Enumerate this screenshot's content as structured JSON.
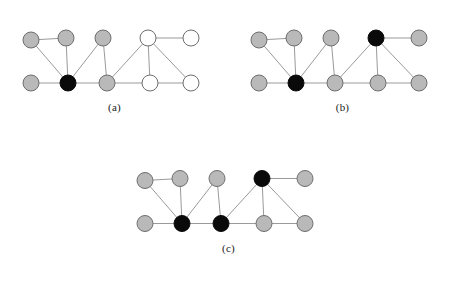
{
  "figure": {
    "type": "graph-diagram-set",
    "colors": {
      "gray_fill": "#b9b9b9",
      "white_fill": "#ffffff",
      "black_fill": "#0a0a0a",
      "node_stroke": "#6e6e6e",
      "edge_stroke": "#9a9a9a",
      "background": "#ffffff",
      "caption_text": "#1a1a1a"
    },
    "node_radius": 8,
    "panels": [
      {
        "id": "a",
        "caption": "(a)",
        "nodes": [
          {
            "id": "n0",
            "x": 31,
            "y": 25,
            "state": "gray"
          },
          {
            "id": "n1",
            "x": 66,
            "y": 23,
            "state": "gray"
          },
          {
            "id": "n2",
            "x": 103,
            "y": 23,
            "state": "gray"
          },
          {
            "id": "n3",
            "x": 148,
            "y": 23,
            "state": "white"
          },
          {
            "id": "n4",
            "x": 191,
            "y": 23,
            "state": "white"
          },
          {
            "id": "n5",
            "x": 31,
            "y": 68,
            "state": "gray"
          },
          {
            "id": "n6",
            "x": 68,
            "y": 68,
            "state": "black"
          },
          {
            "id": "n7",
            "x": 107,
            "y": 68,
            "state": "gray"
          },
          {
            "id": "n8",
            "x": 150,
            "y": 68,
            "state": "white"
          },
          {
            "id": "n9",
            "x": 191,
            "y": 68,
            "state": "white"
          }
        ],
        "edges": [
          [
            "n0",
            "n1"
          ],
          [
            "n0",
            "n6"
          ],
          [
            "n1",
            "n6"
          ],
          [
            "n2",
            "n6"
          ],
          [
            "n5",
            "n6"
          ],
          [
            "n6",
            "n7"
          ],
          [
            "n2",
            "n7"
          ],
          [
            "n7",
            "n3"
          ],
          [
            "n7",
            "n8"
          ],
          [
            "n3",
            "n4"
          ],
          [
            "n3",
            "n8"
          ],
          [
            "n3",
            "n9"
          ],
          [
            "n8",
            "n9"
          ]
        ]
      },
      {
        "id": "b",
        "caption": "(b)",
        "nodes": [
          {
            "id": "n0",
            "x": 31,
            "y": 25,
            "state": "gray"
          },
          {
            "id": "n1",
            "x": 66,
            "y": 23,
            "state": "gray"
          },
          {
            "id": "n2",
            "x": 103,
            "y": 23,
            "state": "gray"
          },
          {
            "id": "n3",
            "x": 148,
            "y": 23,
            "state": "black"
          },
          {
            "id": "n4",
            "x": 191,
            "y": 23,
            "state": "gray"
          },
          {
            "id": "n5",
            "x": 31,
            "y": 68,
            "state": "gray"
          },
          {
            "id": "n6",
            "x": 68,
            "y": 68,
            "state": "black"
          },
          {
            "id": "n7",
            "x": 107,
            "y": 68,
            "state": "gray"
          },
          {
            "id": "n8",
            "x": 150,
            "y": 68,
            "state": "gray"
          },
          {
            "id": "n9",
            "x": 191,
            "y": 68,
            "state": "gray"
          }
        ],
        "edges": [
          [
            "n0",
            "n1"
          ],
          [
            "n0",
            "n6"
          ],
          [
            "n1",
            "n6"
          ],
          [
            "n2",
            "n6"
          ],
          [
            "n5",
            "n6"
          ],
          [
            "n6",
            "n7"
          ],
          [
            "n2",
            "n7"
          ],
          [
            "n7",
            "n3"
          ],
          [
            "n7",
            "n8"
          ],
          [
            "n3",
            "n4"
          ],
          [
            "n3",
            "n8"
          ],
          [
            "n3",
            "n9"
          ],
          [
            "n8",
            "n9"
          ]
        ]
      },
      {
        "id": "c",
        "caption": "(c)",
        "nodes": [
          {
            "id": "n0",
            "x": 31,
            "y": 25,
            "state": "gray"
          },
          {
            "id": "n1",
            "x": 66,
            "y": 23,
            "state": "gray"
          },
          {
            "id": "n2",
            "x": 103,
            "y": 23,
            "state": "gray"
          },
          {
            "id": "n3",
            "x": 148,
            "y": 23,
            "state": "black"
          },
          {
            "id": "n4",
            "x": 191,
            "y": 23,
            "state": "gray"
          },
          {
            "id": "n5",
            "x": 31,
            "y": 68,
            "state": "gray"
          },
          {
            "id": "n6",
            "x": 68,
            "y": 68,
            "state": "black"
          },
          {
            "id": "n7",
            "x": 107,
            "y": 68,
            "state": "black"
          },
          {
            "id": "n8",
            "x": 150,
            "y": 68,
            "state": "gray"
          },
          {
            "id": "n9",
            "x": 191,
            "y": 68,
            "state": "gray"
          }
        ],
        "edges": [
          [
            "n0",
            "n1"
          ],
          [
            "n0",
            "n6"
          ],
          [
            "n1",
            "n6"
          ],
          [
            "n2",
            "n6"
          ],
          [
            "n5",
            "n6"
          ],
          [
            "n6",
            "n7"
          ],
          [
            "n2",
            "n7"
          ],
          [
            "n7",
            "n3"
          ],
          [
            "n7",
            "n8"
          ],
          [
            "n3",
            "n4"
          ],
          [
            "n3",
            "n8"
          ],
          [
            "n3",
            "n9"
          ],
          [
            "n8",
            "n9"
          ]
        ]
      }
    ]
  }
}
